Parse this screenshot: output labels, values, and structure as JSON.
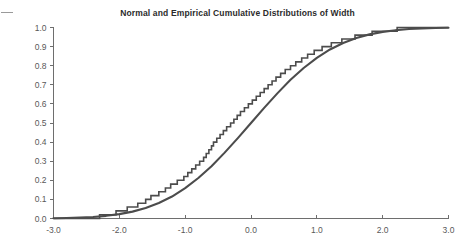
{
  "figure": {
    "title": "Normal and Empirical Cumulative Distributions of Width",
    "background_color": "#ffffff",
    "line_color": "#4c4c4c",
    "axis_color": "#6e6e6e",
    "tick_label_color": "#595959"
  },
  "axes": {
    "x_tick_labels": [
      "-3.0",
      "-2.0",
      "-1.0",
      "0.0",
      "1.0",
      "2.0",
      "3.0"
    ],
    "y_tick_labels": [
      "0.0",
      "0.1",
      "0.2",
      "0.3",
      "0.4",
      "0.5",
      "0.6",
      "0.7",
      "0.8",
      "0.9",
      "1.0"
    ]
  },
  "chart_data": {
    "type": "line",
    "title": "Normal and Empirical Cumulative Distributions of Width",
    "xlabel": "",
    "ylabel": "",
    "xlim": [
      -3.0,
      3.0
    ],
    "ylim": [
      0.0,
      1.0
    ],
    "xticks": [
      -3.0,
      -2.0,
      -1.0,
      0.0,
      1.0,
      2.0,
      3.0
    ],
    "yticks": [
      0.0,
      0.1,
      0.2,
      0.3,
      0.4,
      0.5,
      0.6,
      0.7,
      0.8,
      0.9,
      1.0
    ],
    "grid": false,
    "legend": null,
    "series": [
      {
        "name": "Normal cumulative distribution",
        "style": "smooth-curve",
        "x": [
          -3.0,
          -2.8,
          -2.6,
          -2.4,
          -2.2,
          -2.0,
          -1.8,
          -1.6,
          -1.4,
          -1.2,
          -1.0,
          -0.8,
          -0.6,
          -0.4,
          -0.2,
          0.0,
          0.2,
          0.4,
          0.6,
          0.8,
          1.0,
          1.2,
          1.4,
          1.6,
          1.8,
          2.0,
          2.2,
          2.4,
          2.6,
          2.8,
          3.0
        ],
        "values": [
          0.001,
          0.003,
          0.005,
          0.008,
          0.014,
          0.023,
          0.036,
          0.055,
          0.081,
          0.115,
          0.159,
          0.212,
          0.274,
          0.345,
          0.421,
          0.5,
          0.579,
          0.655,
          0.726,
          0.788,
          0.841,
          0.885,
          0.919,
          0.945,
          0.964,
          0.977,
          0.986,
          0.992,
          0.995,
          0.997,
          0.999
        ]
      },
      {
        "name": "Empirical cumulative distribution",
        "style": "step",
        "n": 50,
        "x": [
          -2.3,
          -2.05,
          -1.88,
          -1.72,
          -1.6,
          -1.52,
          -1.4,
          -1.3,
          -1.22,
          -1.12,
          -1.02,
          -0.96,
          -0.9,
          -0.84,
          -0.78,
          -0.72,
          -0.68,
          -0.64,
          -0.6,
          -0.57,
          -0.52,
          -0.47,
          -0.42,
          -0.37,
          -0.31,
          -0.26,
          -0.21,
          -0.16,
          -0.1,
          -0.04,
          0.02,
          0.08,
          0.14,
          0.2,
          0.26,
          0.32,
          0.38,
          0.45,
          0.52,
          0.6,
          0.68,
          0.77,
          0.86,
          0.96,
          1.08,
          1.22,
          1.38,
          1.58,
          1.84,
          2.22
        ],
        "values": [
          0.02,
          0.04,
          0.06,
          0.08,
          0.1,
          0.12,
          0.14,
          0.16,
          0.18,
          0.2,
          0.22,
          0.24,
          0.26,
          0.28,
          0.3,
          0.32,
          0.34,
          0.36,
          0.38,
          0.4,
          0.42,
          0.44,
          0.46,
          0.48,
          0.5,
          0.52,
          0.54,
          0.56,
          0.58,
          0.6,
          0.62,
          0.64,
          0.66,
          0.68,
          0.7,
          0.72,
          0.74,
          0.76,
          0.78,
          0.8,
          0.82,
          0.84,
          0.86,
          0.88,
          0.9,
          0.92,
          0.94,
          0.96,
          0.98,
          1.0
        ]
      }
    ]
  }
}
